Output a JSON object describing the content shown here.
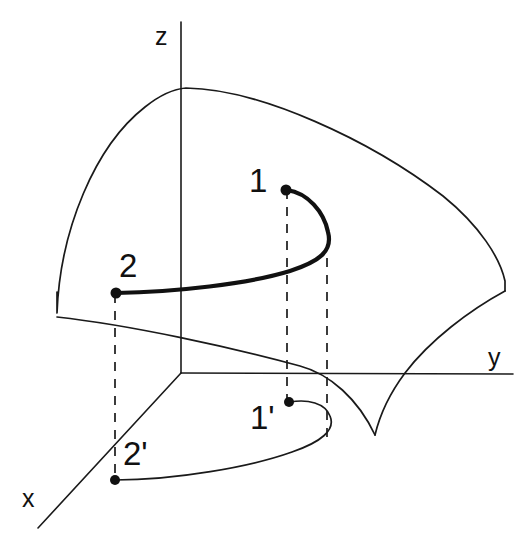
{
  "figure": {
    "background_color": "#ffffff",
    "line_color": "#1a1a1a",
    "width": 531,
    "height": 539
  },
  "axes": {
    "z": {
      "label": "z",
      "label_x": 155,
      "label_y": 45,
      "from_x": 181,
      "from_y": 22,
      "to_x": 181,
      "to_y": 373
    },
    "y": {
      "label": "y",
      "label_x": 488,
      "label_y": 366,
      "from_x": 181,
      "from_y": 373,
      "to_x": 513,
      "to_y": 374
    },
    "x": {
      "label": "x",
      "label_x": 22,
      "label_y": 507,
      "from_x": 181,
      "from_y": 373,
      "to_x": 38,
      "to_y": 528
    }
  },
  "points": [
    {
      "id": "p1",
      "label": "1",
      "x": 286,
      "y": 190,
      "label_x": 249,
      "label_y": 192,
      "space": "3d"
    },
    {
      "id": "p2",
      "label": "2",
      "x": 116,
      "y": 293,
      "label_x": 119,
      "label_y": 277,
      "space": "3d"
    },
    {
      "id": "p1p",
      "label": "1'",
      "x": 289,
      "y": 402,
      "label_x": 250,
      "label_y": 429,
      "space": "projection"
    },
    {
      "id": "p2p",
      "label": "2'",
      "x": 115,
      "y": 480,
      "label_x": 123,
      "label_y": 465,
      "space": "projection"
    }
  ],
  "projectors": [
    {
      "name": "projector-point-1",
      "x": 287,
      "y_top": 190,
      "y_bottom": 400
    },
    {
      "name": "projector-curve-apex",
      "x": 327,
      "y_top": 258,
      "y_bottom": 444
    },
    {
      "name": "projector-point-2",
      "x": 115,
      "y_top": 294,
      "y_bottom": 479
    }
  ],
  "curves": {
    "trajectory_3d": {
      "name": "trajectory-2-to-1",
      "style": "bold",
      "path": "M 116 293 C 175 292 248 284 290 271 C 320 261 333 251 328 232 C 324 212 308 193 287 190"
    },
    "trajectory_projection": {
      "name": "trajectory-2prime-to-1prime",
      "style": "thin",
      "path": "M 115 480 C 175 480 250 467 292 452 C 321 442 336 430 330 416 C 325 403 308 399 290 402"
    },
    "surface_top_edge": {
      "name": "surface-top-edge",
      "path": "M 57 292 L 57 313 C 60 230 95 146 145 107 C 160 95 173 89 186 88 C 260 89 370 140 443 196 C 480 226 500 258 505 281 L 505 291"
    },
    "surface_lower_left_edge": {
      "name": "surface-lower-left-edge",
      "path": "M 57 317 C 130 325 230 347 300 366 C 330 374 358 399 375 435"
    },
    "surface_lower_right_edge": {
      "name": "surface-lower-right-edge",
      "path": "M 505 291 C 470 310 430 340 405 373 C 390 393 380 414 375 435"
    }
  }
}
